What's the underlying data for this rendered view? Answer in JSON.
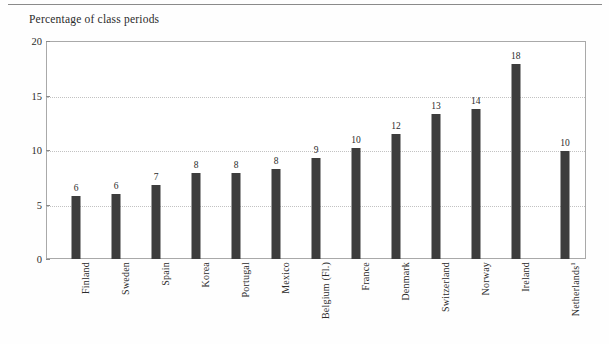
{
  "figure": {
    "title": "Percentage of class periods",
    "has_top_rule": true,
    "background_color": "#fefefe",
    "bar_color": "#3d3d3d",
    "frame_color": "#a9a9a9",
    "gridline_color": "#c2c2c2"
  },
  "chart_data": {
    "type": "bar",
    "title": "Percentage of class periods",
    "xlabel": "",
    "ylabel": "Percentage of class periods",
    "ylim": [
      0,
      20
    ],
    "yticks": [
      0,
      5,
      10,
      15,
      20
    ],
    "ytick_labels": [
      "0",
      "5",
      "10",
      "15",
      "20"
    ],
    "grid": true,
    "grid_axis": "y",
    "legend": false,
    "categories": [
      "Finland",
      "Sweden",
      "Spain",
      "Korea",
      "Portugal",
      "Mexico",
      "Belgium (Fl.)",
      "France",
      "Denmark",
      "Switzerland",
      "Norway",
      "Ireland",
      "Netherlands"
    ],
    "values": [
      6,
      6,
      7,
      8,
      8,
      8,
      9,
      10,
      12,
      13,
      14,
      18,
      10
    ],
    "data_labels": [
      "6",
      "6",
      "7",
      "8",
      "8",
      "8",
      "9",
      "10",
      "12",
      "13",
      "14",
      "18",
      "10"
    ],
    "bar_heights_actual": [
      5.8,
      6.0,
      6.8,
      7.9,
      7.9,
      8.3,
      9.3,
      10.2,
      11.5,
      13.3,
      13.8,
      17.9,
      9.9
    ],
    "footnote_markers": {
      "Netherlands": "1"
    }
  },
  "bars": [
    {
      "label": "Finland",
      "value_label": "6",
      "value": 5.8,
      "x_pct": 5.6,
      "footnote": ""
    },
    {
      "label": "Sweden",
      "value_label": "6",
      "value": 6.0,
      "x_pct": 13.0,
      "footnote": ""
    },
    {
      "label": "Spain",
      "value_label": "7",
      "value": 6.8,
      "x_pct": 20.4,
      "footnote": ""
    },
    {
      "label": "Korea",
      "value_label": "8",
      "value": 7.9,
      "x_pct": 27.8,
      "footnote": ""
    },
    {
      "label": "Portugal",
      "value_label": "8",
      "value": 7.9,
      "x_pct": 35.2,
      "footnote": ""
    },
    {
      "label": "Mexico",
      "value_label": "8",
      "value": 8.3,
      "x_pct": 42.6,
      "footnote": ""
    },
    {
      "label": "Belgium (Fl.)",
      "value_label": "9",
      "value": 9.3,
      "x_pct": 50.0,
      "footnote": ""
    },
    {
      "label": "France",
      "value_label": "10",
      "value": 10.2,
      "x_pct": 57.4,
      "footnote": ""
    },
    {
      "label": "Denmark",
      "value_label": "12",
      "value": 11.5,
      "x_pct": 64.8,
      "footnote": ""
    },
    {
      "label": "Switzerland",
      "value_label": "13",
      "value": 13.3,
      "x_pct": 72.2,
      "footnote": ""
    },
    {
      "label": "Norway",
      "value_label": "14",
      "value": 13.8,
      "x_pct": 79.6,
      "footnote": ""
    },
    {
      "label": "Ireland",
      "value_label": "18",
      "value": 17.9,
      "x_pct": 87.0,
      "footnote": ""
    },
    {
      "label": "Netherlands",
      "value_label": "10",
      "value": 9.9,
      "x_pct": 96.1,
      "footnote": "1"
    }
  ],
  "y_axis": {
    "ticks": [
      {
        "label": "20",
        "value": 20
      },
      {
        "label": "15",
        "value": 15
      },
      {
        "label": "10",
        "value": 10
      },
      {
        "label": "5",
        "value": 5
      },
      {
        "label": "0",
        "value": 0
      }
    ],
    "min": 0,
    "max": 20
  }
}
